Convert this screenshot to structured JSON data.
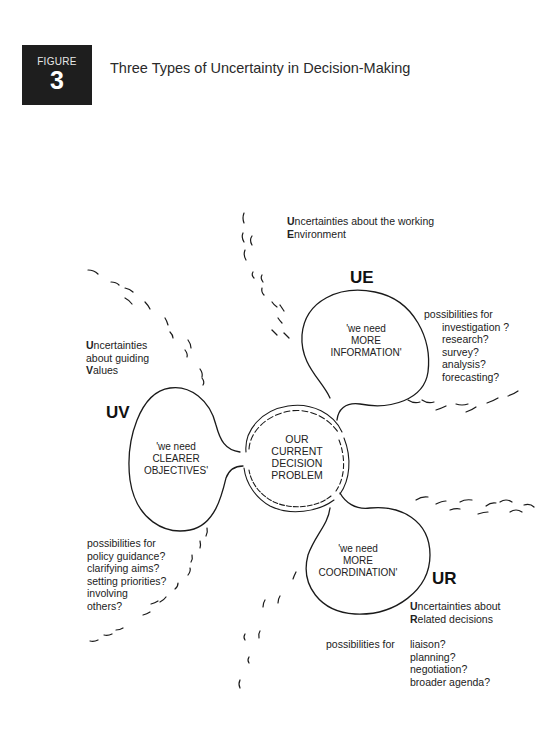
{
  "figure": {
    "label": "FIGURE",
    "number": "3",
    "title": "Three Types of Uncertainty in Decision-Making"
  },
  "center": {
    "lines": [
      "OUR",
      "CURRENT",
      "DECISION",
      "PROBLEM"
    ]
  },
  "ue": {
    "code": "UE",
    "heading_first": "U",
    "heading_rest1": "ncertainties about the working",
    "heading_first2": "E",
    "heading_rest2": "nvironment",
    "bubble": [
      "'we need",
      "MORE",
      "INFORMATION'"
    ],
    "possibilities_label": "possibilities for",
    "possibilities": [
      "investigation ?",
      "research?",
      "survey?",
      "analysis?",
      "forecasting?"
    ]
  },
  "uv": {
    "code": "UV",
    "heading_first": "U",
    "heading_rest1": "ncertainties",
    "heading_line2": "about guiding",
    "heading_first3": "V",
    "heading_rest3": "alues",
    "bubble": [
      "'we need",
      "CLEARER",
      "OBJECTIVES'"
    ],
    "possibilities_label": "possibilities for",
    "possibilities": [
      "policy guidance?",
      "clarifying aims?",
      "setting priorities?",
      "involving",
      "others?"
    ]
  },
  "ur": {
    "code": "UR",
    "heading_first": "U",
    "heading_rest1": "ncertainties about",
    "heading_first2": "R",
    "heading_rest2": "elated decisions",
    "bubble": [
      "'we need",
      "MORE",
      "COORDINATION'"
    ],
    "possibilities_label": "possibilities for",
    "possibilities": [
      "liaison?",
      "planning?",
      "negotiation?",
      "broader agenda?"
    ]
  }
}
